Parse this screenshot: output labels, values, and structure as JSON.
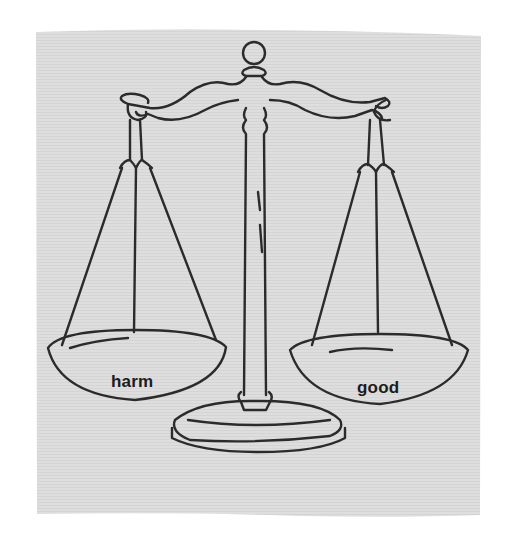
{
  "illustration": {
    "subject": "balance scale",
    "paper_color": "#dcdcdc",
    "ink_color": "#2a2a2a",
    "background_color": "#ffffff"
  },
  "left_pan": {
    "label": "harm"
  },
  "right_pan": {
    "label": "good"
  }
}
